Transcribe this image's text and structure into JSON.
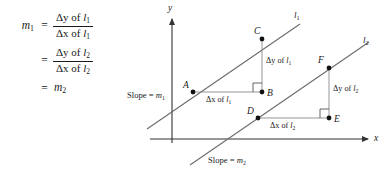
{
  "figure": {
    "equation": {
      "line1": {
        "lhs": "m",
        "lhs_sub": "1",
        "equals": "=",
        "numerator_delta": "Δy",
        "numerator_of": " of ",
        "numerator_line": "l",
        "numerator_sub": "1",
        "denominator_delta": "Δx",
        "denominator_of": " of ",
        "denominator_line": "l",
        "denominator_sub": "1"
      },
      "line2": {
        "lhs": "",
        "equals": "=",
        "numerator_delta": "Δy",
        "numerator_of": " of ",
        "numerator_line": "l",
        "numerator_sub": "2",
        "denominator_delta": "Δx",
        "denominator_of": " of ",
        "denominator_line": "l",
        "denominator_sub": "2"
      },
      "line3": {
        "equals": "=",
        "rhs": "m",
        "rhs_sub": "2"
      }
    },
    "axes": {
      "y_label": "y",
      "x_label": "x"
    },
    "lines": [
      {
        "id": "l1",
        "label": "l",
        "sublabel": "1",
        "slope_note": "Slope = m",
        "slope_note_sub": "1"
      },
      {
        "id": "l2",
        "label": "l",
        "sublabel": "2",
        "slope_note": "Slope = m",
        "slope_note_sub": "2"
      }
    ],
    "points": [
      {
        "name": "A",
        "label": "A"
      },
      {
        "name": "B",
        "label": "B"
      },
      {
        "name": "C",
        "label": "C"
      },
      {
        "name": "D",
        "label": "D"
      },
      {
        "name": "E",
        "label": "E"
      },
      {
        "name": "F",
        "label": "F"
      }
    ],
    "annotations": {
      "dx_l1_delta": "Δx",
      "dx_l1_of": " of ",
      "dx_l1_line": "l",
      "dx_l1_sub": "1",
      "dy_l1_delta": "Δy",
      "dy_l1_of": " of ",
      "dy_l1_line": "l",
      "dy_l1_sub": "1",
      "dx_l2_delta": "Δx",
      "dx_l2_of": " of ",
      "dx_l2_line": "l",
      "dx_l2_sub": "2",
      "dy_l2_delta": "Δy",
      "dy_l2_of": " of ",
      "dy_l2_line": "l",
      "dy_l2_sub": "2",
      "slope_m1_text": "Slope = ",
      "slope_m1_var": "m",
      "slope_m1_sub": "1",
      "slope_m2_text": "Slope = ",
      "slope_m2_var": "m",
      "slope_m2_sub": "2"
    },
    "colors": {
      "ink": "#1a1a1a",
      "line": "#555555",
      "background": "#ffffff"
    }
  }
}
